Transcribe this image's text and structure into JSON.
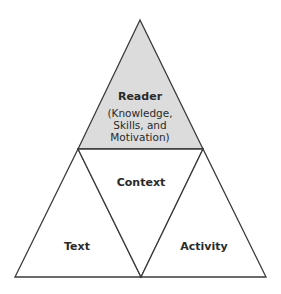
{
  "diagram": {
    "type": "triangle-framework",
    "colors": {
      "stroke": "#3a3a3a",
      "reader_fill": "#dcdcdc",
      "background": "#ffffff",
      "text": "#2a2a2a"
    },
    "reader": {
      "title": "Reader",
      "lines": [
        "(Knowledge,",
        "Skills, and",
        "Motivation)"
      ]
    },
    "context": {
      "title": "Context"
    },
    "text": {
      "title": "Text"
    },
    "activity": {
      "title": "Activity"
    }
  }
}
